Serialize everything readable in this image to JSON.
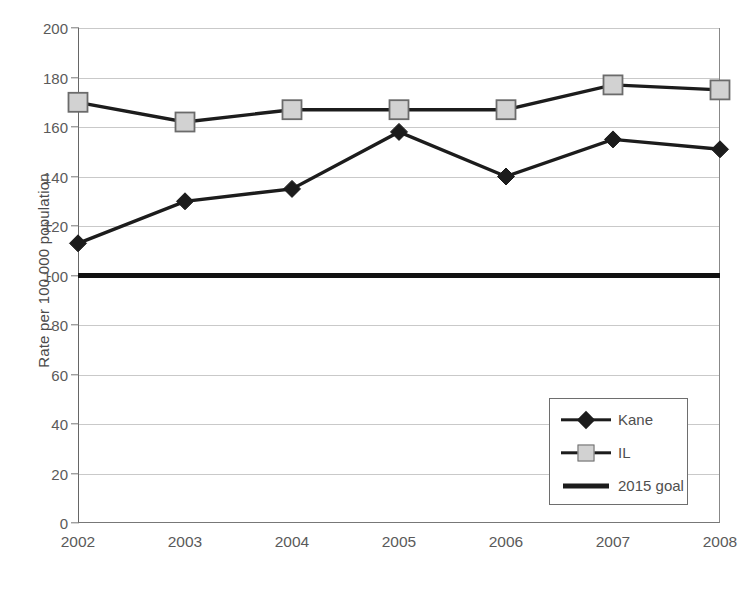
{
  "chart_data": {
    "type": "line",
    "title": "",
    "xlabel": "",
    "ylabel": "Rate per 100,000 population",
    "categories": [
      "2002",
      "2003",
      "2004",
      "2005",
      "2006",
      "2007",
      "2008"
    ],
    "x": [
      2002,
      2003,
      2004,
      2005,
      2006,
      2007,
      2008
    ],
    "series": [
      {
        "name": "Kane",
        "marker": "diamond",
        "color": "#1c1c1c",
        "values": [
          113,
          130,
          135,
          158,
          140,
          155,
          151
        ]
      },
      {
        "name": "IL",
        "marker": "square",
        "color": "#d2d2d2",
        "marker_border_color": "#6b6b6b",
        "line_color": "#1c1c1c",
        "values": [
          170,
          162,
          167,
          167,
          167,
          177,
          175
        ]
      },
      {
        "name": "2015 goal",
        "marker": "none",
        "color": "#111111",
        "values": [
          100,
          100,
          100,
          100,
          100,
          100,
          100
        ]
      }
    ],
    "ylim": [
      0,
      200
    ],
    "ytick_values": [
      0,
      20,
      40,
      60,
      80,
      100,
      120,
      140,
      160,
      180,
      200
    ],
    "ytick_labels": [
      "0",
      "20",
      "40",
      "60",
      "80",
      "100",
      "120",
      "140",
      "160",
      "180",
      "200"
    ],
    "grid": true,
    "grid_axis": "y",
    "grid_color": "#c9c9c9",
    "legend_position": "lower right",
    "background_color": "#ffffff"
  },
  "legend": {
    "entries": [
      {
        "label": "Kane"
      },
      {
        "label": "IL"
      },
      {
        "label": "2015 goal"
      }
    ]
  }
}
